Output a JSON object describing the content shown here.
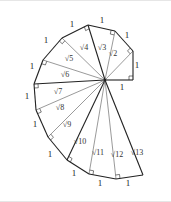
{
  "figure": {
    "center": [
      105,
      80
    ],
    "outer_vertices": [
      [
        133,
        80
      ],
      [
        133,
        51
      ],
      [
        115,
        31
      ],
      [
        88,
        25
      ],
      [
        62,
        38
      ],
      [
        43,
        60
      ],
      [
        34,
        84
      ],
      [
        36,
        110
      ],
      [
        48,
        137
      ],
      [
        67,
        160
      ],
      [
        89,
        174
      ],
      [
        116,
        179
      ],
      [
        143,
        175
      ]
    ],
    "unit_labels": [
      {
        "text": "1",
        "x": 122,
        "y": 90
      },
      {
        "text": "1",
        "x": 137,
        "y": 68
      },
      {
        "text": "1",
        "x": 127,
        "y": 38
      },
      {
        "text": "1",
        "x": 102,
        "y": 23
      },
      {
        "text": "1",
        "x": 72,
        "y": 27
      },
      {
        "text": "1",
        "x": 46,
        "y": 43
      },
      {
        "text": "1",
        "x": 32,
        "y": 69
      },
      {
        "text": "1",
        "x": 27,
        "y": 99
      },
      {
        "text": "1",
        "x": 35,
        "y": 127
      },
      {
        "text": "1",
        "x": 50,
        "y": 157
      },
      {
        "text": "1",
        "x": 74,
        "y": 176
      },
      {
        "text": "1",
        "x": 100,
        "y": 186
      },
      {
        "text": "1",
        "x": 128,
        "y": 186
      }
    ],
    "hypotenuse_labels": [
      {
        "text": "√2",
        "x": 113,
        "y": 56
      },
      {
        "text": "√3",
        "x": 102,
        "y": 50
      },
      {
        "text": "√4",
        "x": 84,
        "y": 50
      },
      {
        "text": "√5",
        "x": 69,
        "y": 61
      },
      {
        "text": "√6",
        "x": 65,
        "y": 77
      },
      {
        "text": "√7",
        "x": 58,
        "y": 94
      },
      {
        "text": "√8",
        "x": 60,
        "y": 110
      },
      {
        "text": "√9",
        "x": 67,
        "y": 127
      },
      {
        "text": "√10",
        "x": 80,
        "y": 144
      },
      {
        "text": "√11",
        "x": 98,
        "y": 155
      },
      {
        "text": "√12",
        "x": 117,
        "y": 157
      },
      {
        "text": "√13",
        "x": 137,
        "y": 155
      }
    ],
    "colors": {
      "stroke": "#222222",
      "thin_stroke": "#555555",
      "background": "#ffffff"
    }
  }
}
